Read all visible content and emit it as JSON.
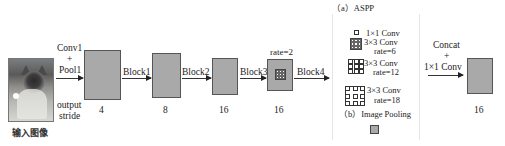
{
  "diagram": {
    "type": "DeepLabv3 ASPP architecture",
    "input": {
      "label": "输入图像",
      "image": "cat-photo"
    },
    "stride_label": [
      "output",
      "stride"
    ],
    "stages": [
      {
        "arrow_label": [
          "Conv1",
          "+",
          "Pool1"
        ],
        "stride": "4"
      },
      {
        "arrow_label": [
          "Block1"
        ],
        "stride": "8"
      },
      {
        "arrow_label": [
          "Block2"
        ],
        "stride": "16"
      },
      {
        "arrow_label": [
          "Block3"
        ],
        "stride": "16",
        "rate": "rate=2"
      }
    ],
    "block4_label": "Block4",
    "aspp": {
      "title": "（a）ASPP",
      "branches": [
        {
          "line1": "1×1 Conv",
          "line2": ""
        },
        {
          "line1": "3×3 Conv",
          "line2": "rate=6"
        },
        {
          "line1": "3×3 Conv",
          "line2": "rate=12"
        },
        {
          "line1": "3×3 Conv",
          "line2": "rate=18"
        }
      ],
      "pooling_title": "（b）Image Pooling"
    },
    "concat_label": [
      "Concat",
      "+",
      "1×1 Conv"
    ],
    "output_stride": "16"
  },
  "colors": {
    "block_fill": "#a9a9a9",
    "block_border": "#555555",
    "line": "#333333",
    "background": "#ffffff"
  }
}
